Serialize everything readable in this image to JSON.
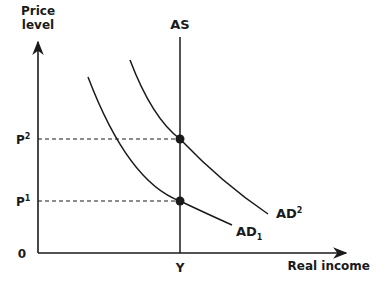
{
  "diagram": {
    "type": "AS-AD diagram",
    "axes": {
      "y_label_line1": "Price",
      "y_label_line2": "level",
      "x_label": "Real income",
      "origin_label": "0"
    },
    "price_levels": [
      {
        "base": "P",
        "sup": "2"
      },
      {
        "base": "P",
        "sup": "1"
      }
    ],
    "income_levels": [
      {
        "label": "Y"
      }
    ],
    "curves": {
      "as": {
        "label": "AS",
        "kind": "vertical supply"
      },
      "ad1": {
        "base": "AD",
        "sub": "1",
        "kind": "downward sloping demand"
      },
      "ad2": {
        "base": "AD",
        "sup": "2",
        "kind": "downward sloping demand, shifted right"
      }
    },
    "equilibria": [
      {
        "name": "AD2 meets AS",
        "price": "P2",
        "income": "Y"
      },
      {
        "name": "AD1 meets AS",
        "price": "P1",
        "income": "Y"
      }
    ],
    "colors": {
      "ink": "#1a1a1a",
      "background": "#ffffff"
    }
  }
}
